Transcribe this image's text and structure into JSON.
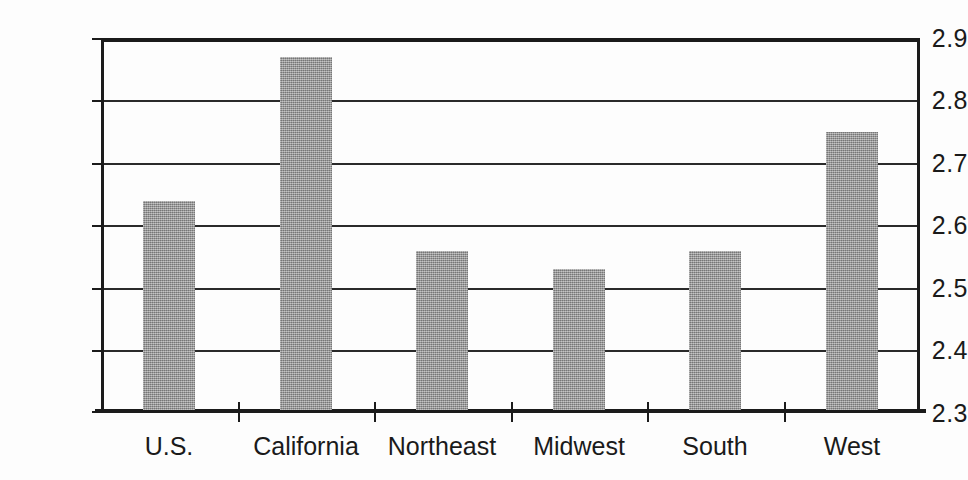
{
  "chart_data": {
    "type": "bar",
    "title": "",
    "subtitle": "",
    "xlabel": "",
    "ylabel": "",
    "categories": [
      "U.S.",
      "California",
      "Northeast",
      "Midwest",
      "South",
      "West"
    ],
    "values": [
      2.64,
      2.87,
      2.56,
      2.53,
      2.56,
      2.75
    ],
    "ylim": [
      2.3,
      2.9
    ],
    "ytick_step": 0.1,
    "ytick_labels": [
      "2.9",
      "2.8",
      "2.7",
      "2.6",
      "2.5",
      "2.4",
      "2.3"
    ],
    "ytick_values": [
      2.9,
      2.8,
      2.7,
      2.6,
      2.5,
      2.4,
      2.3
    ],
    "grid": true,
    "grid_axis": "y",
    "legend": false,
    "legend_position": "none",
    "bar_color": "#9a9a9a",
    "axis_color": "#1b1b1b",
    "background_color": "#fdfdfd"
  }
}
